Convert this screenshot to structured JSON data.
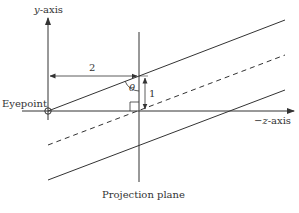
{
  "labels": {
    "y_axis_var": "y",
    "y_axis_suffix": "-axis",
    "z_axis_prefix": "−",
    "z_axis_var": "z",
    "z_axis_suffix": "-axis",
    "eyepoint": "Eyepoint",
    "projection_plane": "Projection plane",
    "distance": "2",
    "height": "1",
    "angle": "θ"
  },
  "colors": {
    "line": "#333333",
    "text": "#333333"
  }
}
